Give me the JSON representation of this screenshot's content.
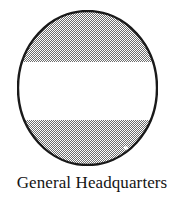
{
  "figure": {
    "name": "general-headquarters-emblem",
    "caption": "General Headquarters",
    "shape": "circle",
    "background_color": "#ffffff",
    "outline_color": "#1a1a1a",
    "outline_width_px": 2,
    "circle": {
      "left_px": 17,
      "top_px": 10,
      "width_px": 141,
      "height_px": 156
    },
    "bands": [
      {
        "name": "top-band",
        "fill": "dither-50-gray",
        "color": "#8c8c8c",
        "from_pct": 0,
        "to_pct": 33.5
      },
      {
        "name": "middle-band",
        "fill": "solid-white",
        "color": "#ffffff",
        "from_pct": 33.5,
        "to_pct": 70.0
      },
      {
        "name": "bottom-band",
        "fill": "dither-50-gray",
        "color": "#8c8c8c",
        "from_pct": 70.0,
        "to_pct": 100
      }
    ],
    "speck": {
      "name": "white-speck-artifact",
      "cx_px": 126,
      "cy_px": 148,
      "r_px": 2,
      "color": "#ffffff"
    }
  }
}
